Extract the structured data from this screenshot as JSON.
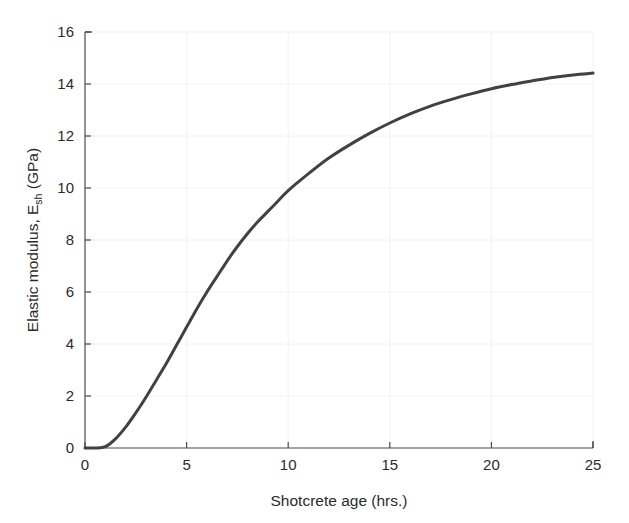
{
  "chart_data": {
    "type": "line",
    "title": "",
    "xlabel": "Shotcrete age (hrs.)",
    "ylabel_main": "Elastic modulus, E",
    "ylabel_sub": "sh",
    "ylabel_unit": " (GPa)",
    "ylabel_full": "Elastic modulus, E_sh (GPa)",
    "xlim": [
      0,
      25
    ],
    "ylim": [
      0,
      16
    ],
    "xticks": [
      0,
      5,
      10,
      15,
      20,
      25
    ],
    "yticks": [
      0,
      2,
      4,
      6,
      8,
      10,
      12,
      14,
      16
    ],
    "xtick_labels": [
      "0",
      "5",
      "10",
      "15",
      "20",
      "25"
    ],
    "ytick_labels": [
      "0",
      "2",
      "4",
      "6",
      "8",
      "10",
      "12",
      "14",
      "16"
    ],
    "grid": true,
    "grid_color": "#f2f2f2",
    "legend": null,
    "line_color": "#414141",
    "line_width": 3,
    "series": [
      {
        "name": "Elastic modulus development",
        "x": [
          0,
          0.5,
          1,
          1.5,
          2,
          2.5,
          3,
          3.5,
          4,
          4.5,
          5,
          5.5,
          6,
          6.5,
          7,
          7.5,
          8,
          8.5,
          9,
          9.5,
          10,
          11,
          12,
          13,
          14,
          15,
          16,
          17,
          18,
          19,
          20,
          21,
          22,
          23,
          24,
          25
        ],
        "y": [
          0.0,
          0.0,
          0.05,
          0.35,
          0.8,
          1.35,
          1.95,
          2.6,
          3.25,
          3.95,
          4.65,
          5.35,
          6.0,
          6.6,
          7.2,
          7.75,
          8.25,
          8.7,
          9.1,
          9.5,
          9.9,
          10.55,
          11.15,
          11.65,
          12.1,
          12.5,
          12.85,
          13.15,
          13.4,
          13.62,
          13.82,
          13.98,
          14.12,
          14.25,
          14.35,
          14.42
        ]
      }
    ]
  },
  "axes": {
    "x_axis_name": "x-axis",
    "y_axis_name": "y-axis"
  }
}
